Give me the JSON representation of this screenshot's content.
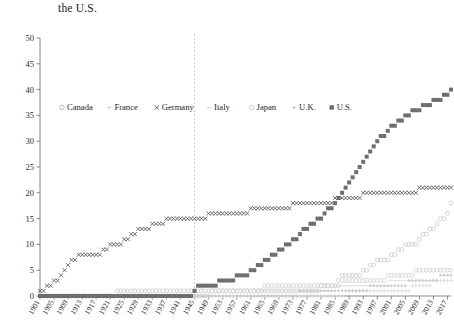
{
  "title": "the U.S.",
  "chart_data": {
    "type": "line",
    "title": "the U.S.",
    "xlabel": "",
    "ylabel": "",
    "xlim": [
      1901,
      2018
    ],
    "ylim": [
      0,
      50
    ],
    "ytick_step": 5,
    "xtick_step": 4,
    "grid": false,
    "legend_position": "inside-top-left",
    "ytick_labels": [
      "0",
      "5",
      "10",
      "15",
      "20",
      "25",
      "30",
      "35",
      "40",
      "45",
      "50"
    ],
    "yticks": [
      0,
      5,
      10,
      15,
      20,
      25,
      30,
      35,
      40,
      45,
      50
    ],
    "xtick_labels": [
      "1901",
      "1905",
      "1909",
      "1913",
      "1917",
      "1921",
      "1925",
      "1929",
      "1933",
      "1937",
      "1941",
      "1945",
      "1949",
      "1953",
      "1957",
      "1961",
      "1965",
      "1969",
      "1973",
      "1977",
      "1981",
      "1985",
      "1989",
      "1993",
      "1997",
      "2001",
      "2005",
      "2009",
      "2013",
      "2017"
    ],
    "xticks": [
      1901,
      1905,
      1909,
      1913,
      1917,
      1921,
      1925,
      1929,
      1933,
      1937,
      1941,
      1945,
      1949,
      1953,
      1957,
      1961,
      1965,
      1969,
      1973,
      1977,
      1981,
      1985,
      1989,
      1993,
      1997,
      2001,
      2005,
      2009,
      2013,
      2017
    ],
    "annotations": [
      {
        "name": "wwii-divider",
        "type": "vline",
        "x": 1945,
        "style": "dashed",
        "color": "#bdbdbd"
      }
    ],
    "x": [
      1901,
      1902,
      1903,
      1904,
      1905,
      1906,
      1907,
      1908,
      1909,
      1910,
      1911,
      1912,
      1913,
      1914,
      1915,
      1916,
      1917,
      1918,
      1919,
      1920,
      1921,
      1922,
      1923,
      1924,
      1925,
      1926,
      1927,
      1928,
      1929,
      1930,
      1931,
      1932,
      1933,
      1934,
      1935,
      1936,
      1937,
      1938,
      1939,
      1940,
      1941,
      1942,
      1943,
      1944,
      1945,
      1946,
      1947,
      1948,
      1949,
      1950,
      1951,
      1952,
      1953,
      1954,
      1955,
      1956,
      1957,
      1958,
      1959,
      1960,
      1961,
      1962,
      1963,
      1964,
      1965,
      1966,
      1967,
      1968,
      1969,
      1970,
      1971,
      1972,
      1973,
      1974,
      1975,
      1976,
      1977,
      1978,
      1979,
      1980,
      1981,
      1982,
      1983,
      1984,
      1985,
      1986,
      1987,
      1988,
      1989,
      1990,
      1991,
      1992,
      1993,
      1994,
      1995,
      1996,
      1997,
      1998,
      1999,
      2000,
      2001,
      2002,
      2003,
      2004,
      2005,
      2006,
      2007,
      2008,
      2009,
      2010,
      2011,
      2012,
      2013,
      2014,
      2015,
      2016,
      2017,
      2018
    ],
    "series": [
      {
        "name": "Canada",
        "marker": "circle-open",
        "color": "#cccccc",
        "values": [
          0,
          0,
          0,
          0,
          0,
          0,
          0,
          0,
          0,
          0,
          0,
          0,
          0,
          0,
          0,
          0,
          0,
          0,
          0,
          0,
          0,
          0,
          1,
          1,
          1,
          1,
          1,
          1,
          1,
          1,
          1,
          1,
          1,
          1,
          1,
          1,
          1,
          1,
          1,
          1,
          1,
          1,
          1,
          1,
          1,
          1,
          1,
          1,
          1,
          1,
          1,
          1,
          1,
          1,
          1,
          1,
          1,
          1,
          1,
          1,
          1,
          1,
          1,
          1,
          1,
          1,
          1,
          1,
          1,
          1,
          1,
          1,
          1,
          1,
          1,
          1,
          1,
          1,
          1,
          1,
          2,
          2,
          2,
          2,
          2,
          3,
          4,
          4,
          4,
          4,
          4,
          4,
          5,
          5,
          6,
          6,
          7,
          7,
          7,
          7,
          8,
          8,
          9,
          9,
          10,
          10,
          10,
          10,
          11,
          12,
          12,
          13,
          13,
          14,
          15,
          15,
          16,
          18
        ]
      },
      {
        "name": "France",
        "marker": "plus",
        "color": "#dcdcdc",
        "values": [
          0,
          0,
          0,
          0,
          0,
          0,
          0,
          0,
          0,
          0,
          0,
          0,
          0,
          0,
          0,
          0,
          0,
          0,
          0,
          0,
          0,
          0,
          0,
          0,
          0,
          0,
          0,
          0,
          0,
          0,
          0,
          0,
          0,
          0,
          0,
          0,
          0,
          0,
          0,
          0,
          0,
          0,
          0,
          0,
          0,
          0,
          0,
          0,
          0,
          0,
          0,
          0,
          0,
          0,
          0,
          0,
          0,
          0,
          0,
          0,
          0,
          0,
          0,
          0,
          0,
          0,
          0,
          0,
          0,
          0,
          0,
          0,
          0,
          0,
          0,
          0,
          0,
          0,
          0,
          0,
          0,
          0,
          0,
          0,
          0,
          0,
          0,
          1,
          1,
          1,
          1,
          1,
          1,
          1,
          1,
          1,
          1,
          1,
          1,
          1,
          1,
          1,
          1,
          1,
          1,
          1,
          2,
          2,
          2,
          2,
          2,
          2,
          3,
          3,
          3,
          3,
          3,
          3
        ]
      },
      {
        "name": "Germany",
        "marker": "x",
        "color": "#555555",
        "values": [
          1,
          1,
          2,
          2,
          3,
          3,
          4,
          5,
          6,
          7,
          7,
          8,
          8,
          8,
          8,
          8,
          8,
          8,
          9,
          9,
          10,
          10,
          10,
          10,
          11,
          11,
          12,
          12,
          13,
          13,
          13,
          13,
          14,
          14,
          14,
          14,
          15,
          15,
          15,
          15,
          15,
          15,
          15,
          15,
          15,
          15,
          15,
          15,
          16,
          16,
          16,
          16,
          16,
          16,
          16,
          16,
          16,
          16,
          16,
          16,
          17,
          17,
          17,
          17,
          17,
          17,
          17,
          17,
          17,
          17,
          17,
          17,
          18,
          18,
          18,
          18,
          18,
          18,
          18,
          18,
          18,
          18,
          18,
          18,
          19,
          19,
          19,
          19,
          19,
          19,
          19,
          19,
          20,
          20,
          20,
          20,
          20,
          20,
          20,
          20,
          20,
          20,
          20,
          20,
          20,
          20,
          20,
          20,
          21,
          21,
          21,
          21,
          21,
          21,
          21,
          21,
          21,
          21
        ]
      },
      {
        "name": "Italy",
        "marker": "dash",
        "color": "#e0e0e0",
        "values": [
          0,
          0,
          0,
          0,
          0,
          0,
          0,
          0,
          0,
          0,
          0,
          0,
          0,
          0,
          0,
          0,
          0,
          0,
          0,
          0,
          0,
          0,
          0,
          0,
          0,
          0,
          0,
          0,
          0,
          0,
          0,
          0,
          0,
          0,
          0,
          0,
          0,
          0,
          0,
          0,
          0,
          0,
          0,
          0,
          0,
          0,
          0,
          0,
          0,
          0,
          0,
          0,
          0,
          0,
          0,
          0,
          0,
          0,
          0,
          0,
          0,
          0,
          1,
          1,
          1,
          1,
          1,
          1,
          1,
          1,
          1,
          1,
          1,
          1,
          1,
          1,
          1,
          1,
          1,
          1,
          1,
          1,
          1,
          1,
          2,
          2,
          2,
          2,
          2,
          2,
          2,
          2,
          2,
          2,
          2,
          2,
          2,
          2,
          2,
          2,
          3,
          3,
          3,
          3,
          3,
          3,
          3,
          3,
          3,
          3,
          3,
          3,
          3,
          3,
          3,
          3,
          3,
          3
        ]
      },
      {
        "name": "Japan",
        "marker": "circle-open-light",
        "color": "#d5d5d5",
        "values": [
          0,
          0,
          0,
          0,
          0,
          0,
          0,
          0,
          0,
          0,
          0,
          0,
          0,
          0,
          0,
          0,
          0,
          0,
          0,
          0,
          0,
          0,
          0,
          0,
          0,
          0,
          0,
          0,
          0,
          0,
          0,
          0,
          0,
          0,
          0,
          0,
          0,
          0,
          0,
          0,
          0,
          0,
          0,
          0,
          0,
          0,
          0,
          0,
          0,
          1,
          1,
          1,
          1,
          1,
          1,
          1,
          1,
          1,
          1,
          1,
          1,
          1,
          1,
          1,
          2,
          2,
          2,
          2,
          2,
          2,
          2,
          2,
          2,
          2,
          2,
          2,
          2,
          2,
          2,
          2,
          2,
          2,
          2,
          2,
          2,
          2,
          3,
          3,
          3,
          3,
          3,
          3,
          3,
          3,
          3,
          3,
          3,
          3,
          3,
          4,
          4,
          4,
          4,
          4,
          4,
          4,
          4,
          5,
          5,
          5,
          5,
          5,
          5,
          5,
          5,
          5,
          5,
          5
        ]
      },
      {
        "name": "U.K.",
        "marker": "dot",
        "color": "#c9c9c9",
        "values": [
          0,
          0,
          0,
          0,
          0,
          0,
          0,
          0,
          0,
          0,
          0,
          0,
          0,
          0,
          0,
          0,
          0,
          0,
          0,
          0,
          0,
          0,
          0,
          0,
          0,
          0,
          0,
          0,
          0,
          0,
          0,
          0,
          0,
          0,
          0,
          0,
          0,
          0,
          0,
          0,
          0,
          0,
          0,
          0,
          0,
          0,
          0,
          0,
          0,
          0,
          0,
          0,
          0,
          0,
          0,
          0,
          0,
          0,
          0,
          0,
          0,
          0,
          0,
          0,
          0,
          0,
          0,
          0,
          0,
          0,
          0,
          0,
          0,
          0,
          1,
          1,
          1,
          1,
          1,
          1,
          1,
          1,
          1,
          1,
          1,
          1,
          1,
          1,
          1,
          1,
          1,
          1,
          1,
          1,
          2,
          2,
          2,
          2,
          2,
          2,
          2,
          2,
          2,
          2,
          2,
          3,
          3,
          3,
          3,
          3,
          3,
          3,
          3,
          3,
          4,
          4,
          4,
          4
        ]
      },
      {
        "name": "U.S.",
        "marker": "square-filled",
        "color": "#6e6e6e",
        "values": [
          0,
          0,
          0,
          0,
          0,
          0,
          0,
          0,
          0,
          0,
          0,
          0,
          0,
          0,
          0,
          0,
          0,
          0,
          0,
          0,
          0,
          0,
          0,
          0,
          0,
          0,
          0,
          0,
          0,
          0,
          0,
          0,
          0,
          0,
          0,
          0,
          0,
          0,
          0,
          0,
          0,
          0,
          0,
          0,
          1,
          2,
          2,
          2,
          2,
          2,
          2,
          3,
          3,
          3,
          3,
          3,
          4,
          4,
          4,
          4,
          5,
          5,
          6,
          6,
          7,
          7,
          8,
          8,
          9,
          9,
          10,
          10,
          11,
          11,
          12,
          13,
          13,
          14,
          14,
          15,
          15,
          16,
          17,
          17,
          18,
          19,
          20,
          21,
          22,
          23,
          24,
          25,
          26,
          27,
          28,
          29,
          30,
          31,
          31,
          32,
          33,
          33,
          34,
          34,
          35,
          35,
          36,
          36,
          36,
          37,
          37,
          37,
          38,
          38,
          38,
          39,
          39,
          40
        ]
      }
    ]
  },
  "legend": {
    "items": [
      {
        "label": "Canada",
        "marker": "circle-open",
        "color": "#b5b5b5"
      },
      {
        "label": "France",
        "marker": "plus",
        "color": "#cfcfcf"
      },
      {
        "label": "Germany",
        "marker": "x",
        "color": "#4a4a4a"
      },
      {
        "label": "Italy",
        "marker": "dash",
        "color": "#d8d8d8"
      },
      {
        "label": "Japan",
        "marker": "circle-open-light",
        "color": "#c5c5c5"
      },
      {
        "label": "U.K.",
        "marker": "dot",
        "color": "#bdbdbd"
      },
      {
        "label": "U.S.",
        "marker": "square-filled",
        "color": "#6e6e6e"
      }
    ]
  }
}
